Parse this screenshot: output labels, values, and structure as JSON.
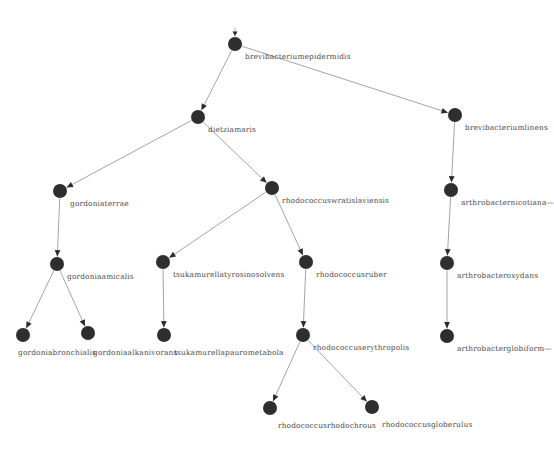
{
  "diagram": {
    "type": "directed-graph",
    "title": "",
    "width": 535,
    "height": 454,
    "background_color": "#ffffff",
    "node_color": "#2e2e2e",
    "edge_color": "#9a9a9a",
    "label_color": "#4a4a4a",
    "node_radius": 7,
    "nodes": [
      {
        "id": "brevibacteriumepidermidis",
        "label": "brevibacteriumepidermidis",
        "x": 235,
        "y": 44,
        "label_dx": 10,
        "label_dy": 9
      },
      {
        "id": "dietziamaris",
        "label": "dietziamaris",
        "x": 198,
        "y": 117,
        "label_dx": 10,
        "label_dy": 9
      },
      {
        "id": "brevibacteriumlinens",
        "label": "brevibacteriumlinens",
        "x": 455,
        "y": 115,
        "label_dx": 10,
        "label_dy": 9
      },
      {
        "id": "gordoniaterrae",
        "label": "gordoniaterrae",
        "x": 60,
        "y": 191,
        "label_dx": 10,
        "label_dy": 9
      },
      {
        "id": "rhodococcuswratislaviensis",
        "label": "rhodococcuswratislaviensis",
        "x": 272,
        "y": 188,
        "label_dx": 10,
        "label_dy": 9
      },
      {
        "id": "arthrobacternicotianae",
        "label": "arthrobacternicotiana—",
        "x": 451,
        "y": 190,
        "label_dx": 10,
        "label_dy": 9
      },
      {
        "id": "gordoniaamicalis",
        "label": "gordoniaamicalis",
        "x": 57,
        "y": 264,
        "label_dx": 10,
        "label_dy": 9
      },
      {
        "id": "tsukamurellatyrosinosolvens",
        "label": "tsukamurellatyrosinosolvens",
        "x": 163,
        "y": 262,
        "label_dx": 10,
        "label_dy": 9
      },
      {
        "id": "rhodococcusruber",
        "label": "rhodococcusruber",
        "x": 306,
        "y": 262,
        "label_dx": 10,
        "label_dy": 9
      },
      {
        "id": "arthrobacteroxydans",
        "label": "arthrobacteroxydans",
        "x": 447,
        "y": 263,
        "label_dx": 10,
        "label_dy": 9
      },
      {
        "id": "gordoniabronchialis",
        "label": "gordoniabronchialis",
        "x": 23,
        "y": 335,
        "label_dx": -5,
        "label_dy": 14
      },
      {
        "id": "gordoniaalkanivorans",
        "label": "gordoniaalkanivorans",
        "x": 88,
        "y": 333,
        "label_dx": 5,
        "label_dy": 16
      },
      {
        "id": "tsukamurellapaurometabola",
        "label": "tsukamurellapaurometabola",
        "x": 164,
        "y": 335,
        "label_dx": 10,
        "label_dy": 14
      },
      {
        "id": "rhodococcuserythropolis",
        "label": "rhodococcuserythropolis",
        "x": 303,
        "y": 335,
        "label_dx": 10,
        "label_dy": 9
      },
      {
        "id": "arthrobacterglobiformis",
        "label": "arthrobacterglobiform—",
        "x": 447,
        "y": 336,
        "label_dx": 10,
        "label_dy": 9
      },
      {
        "id": "rhodococcusrhodochrous",
        "label": "rhodococcusrhodochrous",
        "x": 270,
        "y": 408,
        "label_dx": 8,
        "label_dy": 14
      },
      {
        "id": "rhodococcusgloberulus",
        "label": "rhodococcusgloberulus",
        "x": 372,
        "y": 407,
        "label_dx": 10,
        "label_dy": 14
      }
    ],
    "edges": [
      {
        "from": "brevibacteriumepidermidis",
        "to": "dietziamaris"
      },
      {
        "from": "brevibacteriumepidermidis",
        "to": "brevibacteriumlinens"
      },
      {
        "from": "dietziamaris",
        "to": "gordoniaterrae"
      },
      {
        "from": "dietziamaris",
        "to": "rhodococcuswratislaviensis"
      },
      {
        "from": "brevibacteriumlinens",
        "to": "arthrobacternicotianae"
      },
      {
        "from": "gordoniaterrae",
        "to": "gordoniaamicalis"
      },
      {
        "from": "rhodococcuswratislaviensis",
        "to": "tsukamurellatyrosinosolvens"
      },
      {
        "from": "rhodococcuswratislaviensis",
        "to": "rhodococcusruber"
      },
      {
        "from": "arthrobacternicotianae",
        "to": "arthrobacteroxydans"
      },
      {
        "from": "gordoniaamicalis",
        "to": "gordoniabronchialis"
      },
      {
        "from": "gordoniaamicalis",
        "to": "gordoniaalkanivorans"
      },
      {
        "from": "tsukamurellatyrosinosolvens",
        "to": "tsukamurellapaurometabola"
      },
      {
        "from": "rhodococcusruber",
        "to": "rhodococcuserythropolis"
      },
      {
        "from": "arthrobacteroxydans",
        "to": "arthrobacterglobiformis"
      },
      {
        "from": "rhodococcuserythropolis",
        "to": "rhodococcusrhodochrous"
      },
      {
        "from": "rhodococcuserythropolis",
        "to": "rhodococcusgloberulus"
      }
    ],
    "root_marker": {
      "node": "brevibacteriumepidermidis",
      "dx": 0,
      "dy": -16
    }
  }
}
